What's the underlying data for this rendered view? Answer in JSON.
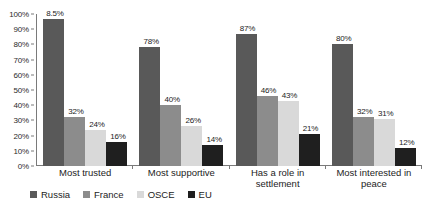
{
  "chart_data": {
    "type": "bar",
    "title": "",
    "subtitle": "",
    "xlabel": "",
    "ylabel": "",
    "ylim": [
      0,
      100
    ],
    "y_ticks": [
      "0%",
      "10%",
      "20%",
      "30%",
      "40%",
      "50%",
      "60%",
      "70%",
      "80%",
      "90%",
      "100%"
    ],
    "y_tick_values": [
      0,
      10,
      20,
      30,
      40,
      50,
      60,
      70,
      80,
      90,
      100
    ],
    "grid": false,
    "legend_position": "bottom-left",
    "categories": [
      "Most trusted",
      "Most supportive",
      "Has a role in settlement",
      "Most interested in peace"
    ],
    "series": [
      {
        "name": "Russia",
        "color": "#595959",
        "values": [
          97,
          78,
          87,
          80
        ],
        "labels": [
          "8.5%",
          "78%",
          "87%",
          "80%"
        ]
      },
      {
        "name": "France",
        "color": "#8c8c8c",
        "values": [
          32,
          40,
          46,
          32
        ],
        "labels": [
          "32%",
          "40%",
          "46%",
          "32%"
        ]
      },
      {
        "name": "OSCE",
        "color": "#d9d9d9",
        "values": [
          24,
          26,
          43,
          31
        ],
        "labels": [
          "24%",
          "26%",
          "43%",
          "31%"
        ]
      },
      {
        "name": "EU",
        "color": "#1f1f1f",
        "values": [
          16,
          14,
          21,
          12
        ],
        "labels": [
          "16%",
          "14%",
          "21%",
          "12%"
        ]
      }
    ]
  }
}
